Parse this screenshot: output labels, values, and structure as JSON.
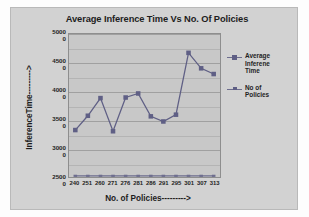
{
  "chart_data": {
    "type": "line",
    "title": "Average Inference Time Vs No. Of Policies",
    "xlabel": "No. of Policies--------->",
    "ylabel": "InferenceTime--------->",
    "categories": [
      "240",
      "251",
      "260",
      "271",
      "276",
      "281",
      "286",
      "291",
      "295",
      "301",
      "307",
      "313"
    ],
    "ylim": [
      25000,
      50000
    ],
    "ytick_labels": [
      "50000",
      "45000",
      "40000",
      "35000",
      "30000",
      "25000"
    ],
    "ytick_values": [
      50000,
      45000,
      40000,
      35000,
      30000,
      25000
    ],
    "grid": true,
    "minor_gridlines": true,
    "legend_position": "right",
    "series": [
      {
        "name": "Average Inferene Time",
        "color": "#5f5f85",
        "marker": "square",
        "values": [
          33200,
          35700,
          38800,
          33000,
          38900,
          39600,
          35600,
          34700,
          35900,
          46700,
          44000,
          43000
        ]
      },
      {
        "name": "No of Policies",
        "color": "#6d6d8e",
        "marker": "dash",
        "values": [
          25200,
          25200,
          25200,
          25200,
          25200,
          25200,
          25200,
          25200,
          25200,
          25200,
          25200,
          25200
        ]
      }
    ]
  },
  "legend": {
    "entries": [
      {
        "label_line1": "Average",
        "label_line2": "Inferene",
        "label_line3": "Time"
      },
      {
        "label_line1": "No of",
        "label_line2": "Policies"
      }
    ]
  }
}
